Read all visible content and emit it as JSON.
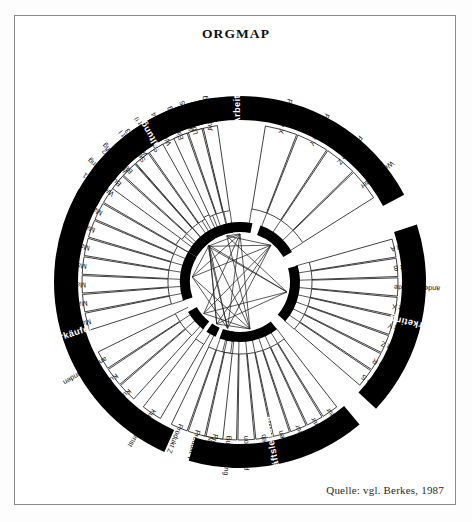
{
  "title": "ORGMAP",
  "source": "Quelle:  vgl. Berkes, 1987",
  "colors": {
    "band": "#000000",
    "band_text": "#ffffff",
    "cell": "#ffffff",
    "ink": "#111111",
    "frame": "#8a8a8a"
  },
  "diagram": {
    "type": "radial-org-map",
    "center": [
      240,
      282
    ],
    "sectors": [
      {
        "id": "arbeiter",
        "band_label": "Arbeiter",
        "groups": [
          {
            "cells": [
              "Werkstatt 1",
              "Werkstatt 2",
              "Werkstatt 3",
              "Werkstatt 4",
              "Werkstatt 5"
            ]
          },
          {
            "cells": [
              "Produkte X",
              "Produkte Y",
              "Produkte Z",
              "Werkmeister"
            ]
          }
        ]
      },
      {
        "id": "marketing",
        "band_label": "Marketing",
        "groups": [
          {
            "cells": [
              "Markt A",
              "Markt B",
              "andere Märkte",
              "Produkt X",
              "Produkt Y",
              "Produkt Z",
              "Kunde R",
              "Kunde S"
            ]
          }
        ]
      },
      {
        "id": "geschaeftsleitung",
        "band_label": "Geschäftsleitung",
        "groups": [
          {
            "cells": [
              "Ingenieur",
              "Ingenieur",
              "Ingenieur",
              "Finanzen",
              "Vertrieb",
              "Produktion",
              "Buchhaltung",
              "Marketing"
            ]
          }
        ]
      },
      {
        "id": "verkaeufer",
        "band_label": "Verkäufer",
        "groups": [
          {
            "cells": [
              "Produkt X",
              "Produkt Y",
              "Produkt Z"
            ]
          },
          {
            "cells": [
              "Kundendienst"
            ]
          },
          {
            "cells": [
              "Kunde R",
              "Kunde S",
              "andere Kunden"
            ]
          },
          {
            "cells": [
              "Markt A",
              "Markt B",
              "Markt C",
              "Markt D",
              "Markt E",
              "Markt F",
              "Markt G"
            ]
          }
        ]
      },
      {
        "id": "verwaltungsstelle",
        "band_label": "Verwaltungsstelle",
        "groups": [
          {
            "cells": [
              "Buchführung",
              "Beschaffung",
              "Sekretariat I",
              "Sekretariat II"
            ]
          },
          {
            "cells": [
              "Einstellung",
              "Löhne",
              "Ausbildung"
            ]
          }
        ]
      }
    ]
  }
}
